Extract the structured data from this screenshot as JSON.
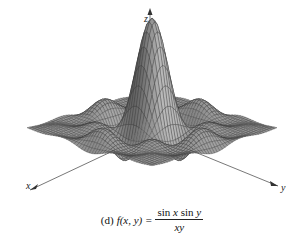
{
  "chart_data": {
    "type": "surface3d",
    "title": "",
    "function": "f(x, y) = sin x sin y / (xy)",
    "x_range": [
      -10,
      10
    ],
    "y_range": [
      -10,
      10
    ],
    "z_range": [
      -0.25,
      1
    ],
    "peak": {
      "x": 0,
      "y": 0,
      "z": 1
    },
    "grid_lines": 48,
    "axes": {
      "x": "x",
      "y": "y",
      "z": "z"
    },
    "grid": false,
    "legend": null
  },
  "caption": {
    "label": "(d)",
    "lhs": "f(x, y) =",
    "numerator_a": "sin",
    "numerator_var_a": "x",
    "numerator_b": "sin",
    "numerator_var_b": "y",
    "denominator": "xy"
  },
  "colors": {
    "surface_fill": "#9a9a9a",
    "surface_dark": "#6e6e6e",
    "mesh_line": "#3a3a3a",
    "axis": "#555555"
  }
}
